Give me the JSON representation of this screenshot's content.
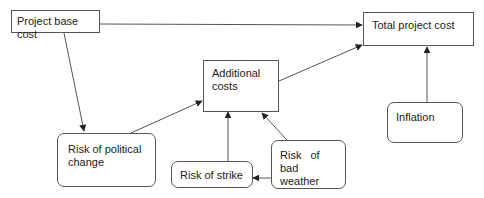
{
  "diagram": {
    "type": "flow",
    "nodes": [
      {
        "id": "project_base_cost",
        "label": "Project base cost",
        "shape": "rect"
      },
      {
        "id": "total_project_cost",
        "label": "Total project cost",
        "shape": "rect"
      },
      {
        "id": "additional_costs",
        "label": "Additional costs",
        "shape": "rect"
      },
      {
        "id": "risk_political_change",
        "label": "Risk of political change",
        "shape": "rounded"
      },
      {
        "id": "risk_strike",
        "label": "Risk of strike",
        "shape": "rounded"
      },
      {
        "id": "risk_bad_weather",
        "label": "Risk of bad weather",
        "shape": "rounded"
      },
      {
        "id": "inflation",
        "label": "Inflation",
        "shape": "rounded"
      }
    ],
    "edges": [
      {
        "from": "project_base_cost",
        "to": "total_project_cost"
      },
      {
        "from": "project_base_cost",
        "to": "risk_political_change"
      },
      {
        "from": "risk_political_change",
        "to": "additional_costs"
      },
      {
        "from": "risk_strike",
        "to": "additional_costs"
      },
      {
        "from": "risk_bad_weather",
        "to": "additional_costs"
      },
      {
        "from": "risk_bad_weather",
        "to": "risk_strike"
      },
      {
        "from": "additional_costs",
        "to": "total_project_cost"
      },
      {
        "from": "inflation",
        "to": "total_project_cost"
      }
    ],
    "colors": {
      "line": "#555555",
      "text": "#222222",
      "background": "#ffffff"
    }
  },
  "labels": {
    "project_base_cost": "Project base cost",
    "total_project_cost": "Total project cost",
    "additional_costs_line1": "Additional",
    "additional_costs_line2": "costs",
    "risk_political_line1": "Risk of political",
    "risk_political_line2": "change",
    "risk_strike": "Risk of strike",
    "risk_weather_line1": "Risk of bad",
    "risk_weather_line2": "weather",
    "inflation": "Inflation"
  }
}
